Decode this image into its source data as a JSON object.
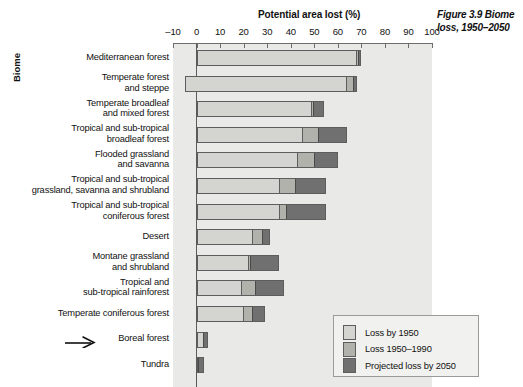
{
  "caption": "Figure 3.9 Biome loss, 1950–2050",
  "axis": {
    "title": "Potential area lost (%)",
    "y_title": "Biome",
    "ticks": [
      -10,
      0,
      10,
      20,
      30,
      40,
      50,
      60,
      70,
      80,
      90,
      100
    ],
    "tick_labels": [
      "–10",
      "0",
      "10",
      "20",
      "30",
      "40",
      "50",
      "60",
      "70",
      "80",
      "90",
      "100"
    ],
    "min": -10,
    "max": 100
  },
  "legend": {
    "items": [
      {
        "label": "Loss by 1950",
        "color": "#d4d4d0"
      },
      {
        "label": "Loss 1950–1990",
        "color": "#b2b2ac"
      },
      {
        "label": "Projected loss by 2050",
        "color": "#707070"
      }
    ]
  },
  "annotation": {
    "arrow_target": "Boreal forest",
    "icon": "arrow-right-icon"
  },
  "chart_data": {
    "type": "bar",
    "orientation": "horizontal",
    "stacked": true,
    "title": "Figure 3.9 Biome loss, 1950–2050",
    "xlabel": "Potential area lost (%)",
    "ylabel": "Biome",
    "xlim": [
      -10,
      100
    ],
    "grid": false,
    "legend_position": "bottom-right",
    "series": [
      {
        "name": "Loss by 1950",
        "color": "#d4d4d0"
      },
      {
        "name": "Loss 1950–1990",
        "color": "#b2b2ac"
      },
      {
        "name": "Projected loss by 2050",
        "color": "#707070"
      }
    ],
    "categories": [
      "Mediterranean forest",
      "Temperate forest and steppe",
      "Temperate broadleaf and mixed forest",
      "Tropical and sub-tropical broadleaf forest",
      "Flooded grassland and savanna",
      "Tropical and sub-tropical grassland, savanna and shrubland",
      "Tropical and sub-tropical coniferous forest",
      "Desert",
      "Montane grassland and shrubland",
      "Tropical and sub-tropical rainforest",
      "Temperate coniferous forest",
      "Boreal forest",
      "Tundra"
    ],
    "values": {
      "Loss by 1950": [
        68,
        69,
        49,
        45,
        43,
        35,
        35,
        24,
        22,
        19,
        20,
        3,
        0
      ],
      "Loss 1950–1990": [
        1,
        3,
        1,
        7,
        7,
        7,
        3,
        4,
        1,
        6,
        4,
        0,
        0
      ],
      "Projected loss by 2050": [
        1,
        1,
        4,
        12,
        10,
        13,
        17,
        3,
        12,
        12,
        5,
        2,
        3
      ]
    }
  },
  "rows": [
    {
      "label": "Mediterranean forest",
      "label_lines": [
        "Mediterranean forest"
      ],
      "start": 0,
      "s1": 68,
      "s2": 1,
      "s3": 1
    },
    {
      "label": "Temperate forest and steppe",
      "label_lines": [
        "Temperate forest",
        "and steppe"
      ],
      "start": -5,
      "s1": 69,
      "s2": 3,
      "s3": 1
    },
    {
      "label": "Temperate broadleaf and mixed forest",
      "label_lines": [
        "Temperate broadleaf",
        "and mixed forest"
      ],
      "start": 0,
      "s1": 49,
      "s2": 1,
      "s3": 4
    },
    {
      "label": "Tropical and sub-tropical broadleaf forest",
      "label_lines": [
        "Tropical and sub-tropical",
        "broadleaf forest"
      ],
      "start": 0,
      "s1": 45,
      "s2": 7,
      "s3": 12
    },
    {
      "label": "Flooded grassland and savanna",
      "label_lines": [
        "Flooded grassland",
        "and savanna"
      ],
      "start": 0,
      "s1": 43,
      "s2": 7,
      "s3": 10
    },
    {
      "label": "Tropical and sub-tropical grassland, savanna and shrubland",
      "label_lines": [
        "Tropical and sub-tropical",
        "grassland, savanna and shrubland"
      ],
      "start": 0,
      "s1": 35,
      "s2": 7,
      "s3": 13
    },
    {
      "label": "Tropical and sub-tropical coniferous forest",
      "label_lines": [
        "Tropical and sub-tropical",
        "coniferous forest"
      ],
      "start": 0,
      "s1": 35,
      "s2": 3,
      "s3": 17
    },
    {
      "label": "Desert",
      "label_lines": [
        "Desert"
      ],
      "start": 0,
      "s1": 24,
      "s2": 4,
      "s3": 3
    },
    {
      "label": "Montane grassland and shrubland",
      "label_lines": [
        "Montane grassland",
        "and shrubland"
      ],
      "start": 0,
      "s1": 22,
      "s2": 1,
      "s3": 12
    },
    {
      "label": "Tropical and sub-tropical rainforest",
      "label_lines": [
        "Tropical and",
        "sub-tropical rainforest"
      ],
      "start": 0,
      "s1": 19,
      "s2": 6,
      "s3": 12
    },
    {
      "label": "Temperate coniferous forest",
      "label_lines": [
        "Temperate coniferous forest"
      ],
      "start": 0,
      "s1": 20,
      "s2": 4,
      "s3": 5
    },
    {
      "label": "Boreal forest",
      "label_lines": [
        "Boreal forest"
      ],
      "start": 0,
      "s1": 3,
      "s2": 0,
      "s3": 2
    },
    {
      "label": "Tundra",
      "label_lines": [
        "Tundra"
      ],
      "start": 0,
      "s1": 0,
      "s2": 0,
      "s3": 3
    }
  ]
}
